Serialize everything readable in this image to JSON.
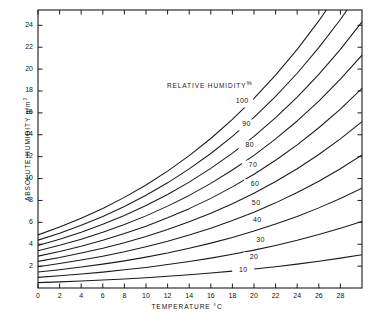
{
  "chart_data": {
    "type": "line",
    "title": "",
    "xlabel": "TEMPERATURE °C",
    "ylabel": "ABSOLUTE HUMIDITY g/m",
    "ylabel_exponent": "3",
    "xlabel_unit": "°C",
    "legend_title": "RELATIVE HUMIDITY",
    "legend_unit": "%",
    "legend_position": "inside-upper-center",
    "grid": false,
    "xlim": [
      0,
      30
    ],
    "ylim": [
      0,
      25.4
    ],
    "xticks": [
      0,
      2,
      4,
      6,
      8,
      10,
      12,
      14,
      16,
      18,
      20,
      22,
      24,
      26,
      28
    ],
    "xtick_labels": [
      "0",
      "2",
      "4",
      "6",
      "8",
      "10",
      "12",
      "14",
      "16",
      "18",
      "20",
      "22",
      "24",
      "26",
      "28"
    ],
    "yticks": [
      2,
      4,
      6,
      8,
      10,
      12,
      14,
      16,
      18,
      20,
      22,
      24
    ],
    "ytick_labels": [
      "2",
      "4",
      "6",
      "8",
      "10",
      "12",
      "14",
      "16",
      "18",
      "20",
      "22",
      "24"
    ],
    "x": [
      0,
      2,
      4,
      6,
      8,
      10,
      12,
      14,
      16,
      18,
      20,
      22,
      24,
      26,
      28,
      30
    ],
    "series": [
      {
        "name": "100",
        "label": "100",
        "label_x": 18.9,
        "label_y": 17.0,
        "values": [
          4.85,
          5.57,
          6.37,
          7.27,
          8.28,
          9.41,
          10.68,
          12.09,
          13.66,
          15.4,
          17.32,
          19.45,
          21.8,
          24.4,
          27.25,
          30.4
        ]
      },
      {
        "name": "90",
        "label": "90",
        "label_x": 19.3,
        "label_y": 14.9,
        "values": [
          4.37,
          5.01,
          5.73,
          6.54,
          7.45,
          8.47,
          9.61,
          10.88,
          12.29,
          13.86,
          15.59,
          17.51,
          19.62,
          21.96,
          24.53,
          27.36
        ]
      },
      {
        "name": "80",
        "label": "80",
        "label_x": 19.6,
        "label_y": 13.0,
        "values": [
          3.88,
          4.45,
          5.1,
          5.82,
          6.62,
          7.53,
          8.54,
          9.67,
          10.93,
          12.32,
          13.86,
          15.56,
          17.44,
          19.52,
          21.8,
          24.32
        ]
      },
      {
        "name": "70",
        "label": "70",
        "label_x": 19.9,
        "label_y": 11.15,
        "values": [
          3.4,
          3.9,
          4.46,
          5.09,
          5.8,
          6.59,
          7.48,
          8.46,
          9.56,
          10.78,
          12.12,
          13.62,
          15.26,
          17.08,
          19.08,
          21.28
        ]
      },
      {
        "name": "60",
        "label": "60",
        "label_x": 20.1,
        "label_y": 9.45,
        "values": [
          2.91,
          3.34,
          3.82,
          4.36,
          4.97,
          5.65,
          6.41,
          7.25,
          8.19,
          9.24,
          10.39,
          11.67,
          13.08,
          14.64,
          16.35,
          18.24
        ]
      },
      {
        "name": "50",
        "label": "50",
        "label_x": 20.2,
        "label_y": 7.7,
        "values": [
          2.43,
          2.78,
          3.19,
          3.64,
          4.14,
          4.71,
          5.34,
          6.05,
          6.83,
          7.7,
          8.66,
          9.73,
          10.9,
          12.2,
          13.63,
          15.2
        ]
      },
      {
        "name": "40",
        "label": "40",
        "label_x": 20.3,
        "label_y": 6.1,
        "values": [
          1.94,
          2.23,
          2.55,
          2.91,
          3.31,
          3.76,
          4.27,
          4.84,
          5.46,
          6.16,
          6.93,
          7.78,
          8.72,
          9.76,
          10.9,
          12.16
        ]
      },
      {
        "name": "30",
        "label": "30",
        "label_x": 20.6,
        "label_y": 4.3,
        "values": [
          1.46,
          1.67,
          1.91,
          2.18,
          2.48,
          2.82,
          3.2,
          3.63,
          4.1,
          4.62,
          5.2,
          5.84,
          6.54,
          7.32,
          8.18,
          9.12
        ]
      },
      {
        "name": "20",
        "label": "20",
        "label_x": 20.0,
        "label_y": 2.75,
        "values": [
          0.97,
          1.11,
          1.27,
          1.45,
          1.66,
          1.88,
          2.14,
          2.42,
          2.73,
          3.08,
          3.46,
          3.89,
          4.36,
          4.88,
          5.45,
          6.08
        ]
      },
      {
        "name": "10",
        "label": "10",
        "label_x": 19.0,
        "label_y": 1.55,
        "values": [
          0.49,
          0.56,
          0.64,
          0.73,
          0.83,
          0.94,
          1.07,
          1.21,
          1.37,
          1.54,
          1.73,
          1.95,
          2.18,
          2.44,
          2.73,
          3.04
        ]
      }
    ]
  },
  "plot": {
    "frame": {
      "left": 38,
      "top": 10,
      "right": 362,
      "bottom": 288
    },
    "stroke_color": "#1a1a1a"
  }
}
